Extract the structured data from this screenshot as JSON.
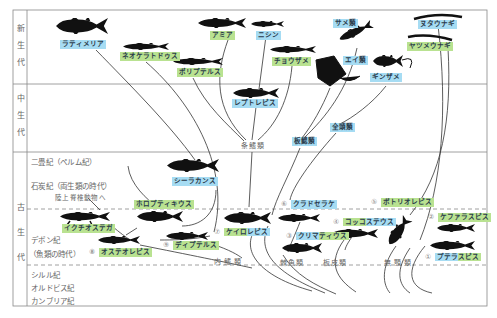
{
  "eras": [
    {
      "label": "新生代",
      "chars": [
        "新",
        "生",
        "代"
      ]
    },
    {
      "label": "中生代",
      "chars": [
        "中",
        "生",
        "代"
      ]
    },
    {
      "label": "古生代",
      "chars": [
        "古",
        "生",
        "代"
      ]
    }
  ],
  "periods": {
    "permian": "二畳紀（ペルム紀）",
    "carboniferous": "石炭紀（両生類の時代）",
    "to_tetrapods": "陸上脊椎動物へ",
    "devonian": "デボン紀",
    "devonian_note": "（魚類の時代）",
    "silurian": "シルル紀",
    "ordovician": "オルドビス紀",
    "cambrian": "カンブリア紀"
  },
  "groups": {
    "actinopterygii": "条鰭類",
    "elasmobranchii": "板鰓類",
    "holocephali": "全頭類",
    "sarcopterygii": "内鰭類",
    "acanthodii": "棘魚類",
    "placodermi": "板皮類",
    "agnatha": "無顎類"
  },
  "species": {
    "latimeria": "ラティメリア",
    "neoceratodus": "ネオケラトドゥス",
    "amia": "アミア",
    "herring": "ニシン",
    "sharks": "サメ類",
    "hagfish": "ヌタウナギ",
    "lamprey": "ヤツメウナギ",
    "sturgeon": "チョウザメ",
    "rays": "エイ類",
    "polypterus": "ポリプテルス",
    "chimaera": "ギンザメ",
    "leptolepis": "レプトレピス",
    "coelacanth": "シーラカンス",
    "holoptychius": "ホロプティキウス",
    "ichthyostega": "イクチオステガ",
    "cladoselache": {
      "num": "⑥",
      "name": "クラドセラケ"
    },
    "bothriolepis": {
      "num": "⑤",
      "name": "ボトリオレピス"
    },
    "cephalaspis": {
      "num": "②",
      "name": "ケファラスピス"
    },
    "coccosteus": {
      "num": "④",
      "part1": "コッコ",
      "part2": "ステウス"
    },
    "climatius": {
      "num": "③",
      "part1": "クリマ",
      "part2": "ティウス"
    },
    "cheirolepis": {
      "num": "⑦",
      "part1": "ケイロ",
      "part2": "レピス"
    },
    "osteolepis": {
      "num": "⑧",
      "name": "オステオレピス"
    },
    "dipterus": {
      "num": "⑨",
      "name": "ディプテルス"
    },
    "pteraspis": {
      "num": "①",
      "part1": "プテラ",
      "part2": "スピス"
    }
  },
  "colors": {
    "blue_label": "#a6dcf3",
    "green_label": "#b9e291",
    "line": "#333333",
    "frame": "#888888"
  }
}
